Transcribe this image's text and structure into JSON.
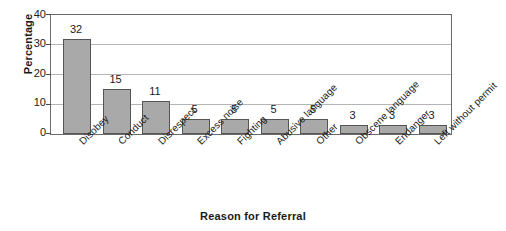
{
  "chart_data": {
    "type": "bar",
    "title": "",
    "xlabel": "Reason for Referral",
    "ylabel": "Percentage",
    "categories": [
      "Disobey",
      "Conduct",
      "Disrespect",
      "Excess noise",
      "Fighting",
      "Abusive language",
      "Other",
      "Obscene language",
      "Endanger",
      "Left without permit"
    ],
    "values": [
      32,
      15,
      11,
      5,
      5,
      5,
      5,
      3,
      3,
      3
    ],
    "ylim": [
      0,
      40
    ],
    "yticks": [
      0,
      10,
      20,
      30,
      40
    ],
    "ytick_labels": [
      "0",
      "10",
      "20",
      "30",
      "40"
    ],
    "grid": "horizontal",
    "legend": "none",
    "bar_color": "#a9a9a9",
    "bar_border_color": "#555555",
    "gridline_color": "#b4b4b4",
    "axis_color": "#6b6b6b",
    "text_color": "#1a1a1a",
    "data_labels": [
      "32",
      "15",
      "11",
      "5",
      "5",
      "5",
      "5",
      "3",
      "3",
      "3"
    ]
  }
}
